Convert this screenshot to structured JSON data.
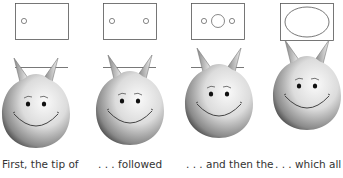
{
  "diagram": {
    "panels": [
      {
        "id": "stage-1",
        "caption": "First, the tip of",
        "opening": "one small circle on the left"
      },
      {
        "id": "stage-2",
        "caption": ". . . followed",
        "opening": "two small circles"
      },
      {
        "id": "stage-3",
        "caption": ". . . and then the",
        "opening": "two small circles with a larger circle between"
      },
      {
        "id": "stage-4",
        "caption": ". . . which all",
        "opening": "one large ellipse filling the box"
      }
    ],
    "colors": {
      "outline": "#555555",
      "face_light": "#f4f4f4",
      "face_dark": "#3a3a3a",
      "text": "#333333"
    }
  }
}
